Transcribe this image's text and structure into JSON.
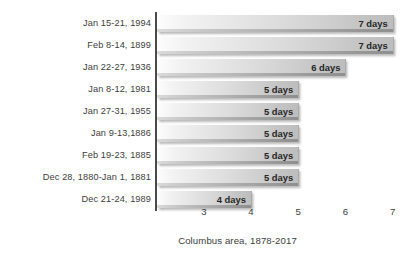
{
  "chart_data": {
    "type": "bar",
    "orientation": "horizontal",
    "title": "",
    "subtitle": "",
    "xlabel": "Columbus area, 1878-2017",
    "ylabel": "",
    "xlim": [
      2,
      7.4
    ],
    "xticks": [
      3,
      4,
      5,
      6,
      7
    ],
    "xtick_labels": [
      "3",
      "4",
      "5",
      "6",
      "7"
    ],
    "grid": false,
    "legend": false,
    "categories": [
      "Jan 15-21, 1994",
      "Feb 8-14, 1899",
      "Jan 22-27, 1936",
      "Jan 8-12, 1981",
      "Jan 27-31, 1955",
      "Jan 9-13,1886",
      "Feb 19-23, 1885",
      "Dec 28, 1880-Jan 1, 1881",
      "Dec 21-24, 1989"
    ],
    "values": [
      7,
      7,
      6,
      5,
      5,
      5,
      5,
      5,
      4
    ],
    "value_labels": [
      "7 days",
      "7 days",
      "6 days",
      "5 days",
      "5 days",
      "5 days",
      "5 days",
      "5 days",
      "4 days"
    ],
    "bar_color_start": "#fdfdfd",
    "bar_color_end": "#bdbdbd",
    "axis_color": "#4a4a4a",
    "text_color": "#3d3d3d"
  },
  "caption": {
    "text": "Columbus area, 1878-2017"
  }
}
